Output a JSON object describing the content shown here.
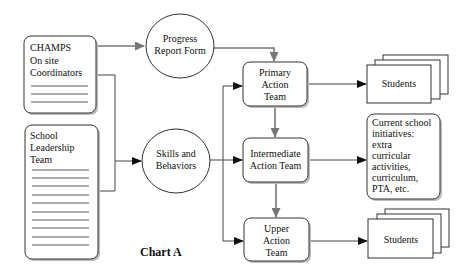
{
  "diagram": {
    "title": "Chart A",
    "nodes": {
      "champs": {
        "lines": [
          "CHAMPS",
          "On site",
          "Coordinators"
        ],
        "shape": "rounded-rect-with-lines"
      },
      "leadership": {
        "lines": [
          "School",
          "Leadership",
          "Team"
        ],
        "shape": "rounded-rect-with-lines"
      },
      "progress": {
        "lines": [
          "Progress",
          "Report Form"
        ],
        "shape": "ellipse"
      },
      "skills": {
        "lines": [
          "Skills and",
          "Behaviors"
        ],
        "shape": "ellipse"
      },
      "primary": {
        "lines": [
          "Primary",
          "Action",
          "Team"
        ],
        "shape": "rounded-rect"
      },
      "intermediate": {
        "lines": [
          "Intermediate",
          "Action Team"
        ],
        "shape": "rounded-rect"
      },
      "upper": {
        "lines": [
          "Upper",
          "Action",
          "Team"
        ],
        "shape": "rounded-rect"
      },
      "students_top": {
        "lines": [
          "Students"
        ],
        "shape": "stacked-pages"
      },
      "initiatives": {
        "lines": [
          "Current school",
          "initiatives:",
          "extra",
          "curricular",
          "activities,",
          "curriculum,",
          "PTA, etc."
        ],
        "shape": "rounded-rect"
      },
      "students_bottom": {
        "lines": [
          "Students"
        ],
        "shape": "stacked-pages"
      }
    },
    "edges": [
      {
        "from": "champs",
        "to": "progress",
        "style": "gray"
      },
      {
        "from": "progress",
        "to": "primary",
        "style": "gray"
      },
      {
        "from": "champs",
        "to": "skills",
        "style": "black"
      },
      {
        "from": "leadership",
        "to": "skills",
        "style": "black"
      },
      {
        "from": "skills",
        "to": "primary",
        "style": "black"
      },
      {
        "from": "skills",
        "to": "intermediate",
        "style": "black"
      },
      {
        "from": "skills",
        "to": "upper",
        "style": "black"
      },
      {
        "from": "primary",
        "to": "intermediate",
        "style": "gray"
      },
      {
        "from": "intermediate",
        "to": "upper",
        "style": "gray"
      },
      {
        "from": "primary",
        "to": "students_top",
        "style": "black"
      },
      {
        "from": "intermediate",
        "to": "initiatives",
        "style": "black"
      },
      {
        "from": "upper",
        "to": "students_bottom",
        "style": "black"
      }
    ],
    "colors": {
      "line": "#444444",
      "gray_arrow": "#777777",
      "shadow": "#bdbdbd"
    }
  }
}
